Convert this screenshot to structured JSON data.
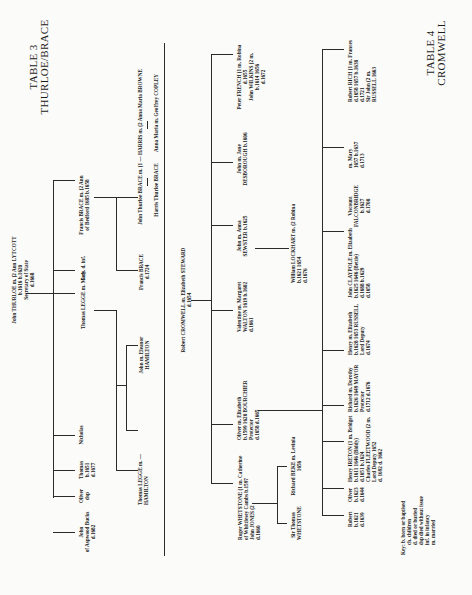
{
  "table3": {
    "title_line1": "TABLE 3",
    "title_line2": "THURLOE/BRACE",
    "root": [
      "John THURLOE m. (2 Ann LYTCOTT",
      "b.1616            b.1620",
      "Secretary of State",
      "d.1668"
    ],
    "children": [
      {
        "lines": [
          "John",
          "of Aspwood Bucks",
          "d.1682"
        ]
      },
      {
        "lines": [
          "Oliver",
          "",
          "dsp"
        ]
      },
      {
        "lines": [
          "Thomas",
          "b.1651",
          "d.1677"
        ]
      },
      {
        "lines": [
          "Nicholas"
        ]
      },
      {
        "lines": [
          "Thomas LEGGE m. Mary"
        ]
      },
      {
        "lines": [
          "5 ch. d. inf."
        ]
      },
      {
        "lines": [
          "Francis BRACE m. (2 Ann",
          "of Bedford 1685   b.1658"
        ]
      }
    ],
    "legge_children": [
      {
        "lines": [
          "Thomas LEGGE    m. —",
          "                HAMILTON"
        ]
      },
      {
        "lines": [
          "John m. Eleanor",
          "HAMILTON"
        ]
      }
    ],
    "brace_children": [
      {
        "lines": [
          "Francis BRACE",
          "d.1724"
        ]
      },
      {
        "lines": [
          "John Thurloe BRACE m. (1 — HARRIS    m. (2 Anna Maria BROWNE"
        ]
      }
    ],
    "brace_grandchildren": [
      {
        "lines": [
          "Harris Thurloe BRACE"
        ]
      },
      {
        "lines": [
          "Anna Maria m. Geoffrey COPLEY"
        ]
      }
    ]
  },
  "table4": {
    "title_line1": "TABLE 4",
    "title_line2": "CROMWELL",
    "root": [
      "Robert CROMWELL m. Elizabeth STEWARD",
      "d.1654"
    ],
    "children": [
      {
        "lines": [
          "Roger WHETSTONE (1 m. Catherine",
          "of Whittlesey Cambs   b.1597",
          "John JONES (2",
          "d.1660"
        ]
      },
      {
        "lines": [
          "Oliver    m.    Elizabeth",
          "b.1599   1620  BOURCHIER",
          "Protector",
          "d.1658          d.1665"
        ]
      },
      {
        "lines": [
          "Valentine m. Margaret",
          "WALTON  1619  b.1602",
          "",
          "d.1661"
        ]
      },
      {
        "lines": [
          "William LOCKHART m. (2 Robina",
          "b.1621         1654",
          "d.1676"
        ]
      },
      {
        "lines": [
          "John m. Anna",
          "SEWSTER  b.1625"
        ]
      },
      {
        "lines": [
          "John m. Jane",
          "DESBOROUGH  b.1606"
        ]
      },
      {
        "lines": [
          "Peter FRENCH (1 m. Robina",
          "d.1655",
          "John WILKINS (2 m.",
          "b.1614       1656",
          "d.1672"
        ]
      }
    ],
    "whetstone_children": [
      {
        "lines": [
          "Sir Thomas",
          "WHETSTONE"
        ]
      },
      {
        "lines": [
          "Richard BEKE m. Levinia",
          "1656"
        ]
      }
    ],
    "oliver_children": [
      {
        "lines": [
          "Robert",
          "b.1621",
          "d.1639"
        ]
      },
      {
        "lines": [
          "Oliver",
          "b.1623",
          "d.1644"
        ]
      },
      {
        "lines": [
          "Henry IRETON (1 m. Bridget",
          "b.1611         1646 (Biddy)",
          "d.1651               b.1624",
          "Charles FLEETWOOD (2 m.",
          "Lord Deputy    1652",
          "d. 1692              d. 1662"
        ]
      },
      {
        "lines": [
          "Richard m.   Dorothy",
          "b.1626  1649 MAYOR",
          "Protector",
          "d.1712          d.1676"
        ]
      },
      {
        "lines": [
          "Henry    m. Elizabeth",
          "b.1628  1653 RUSSELL",
          "Lord Deputy",
          "d.1674"
        ]
      },
      {
        "lines": [
          "John CLAYPOLE m. Elizabeth",
          "b.1625   1646 (Bettie)",
          "d.1688        b.1629",
          "              d.1658"
        ]
      },
      {
        "lines": [
          "Viscount",
          "FALCONBRIDGE",
          "b.1627",
          "d.1700"
        ]
      },
      {
        "lines": [
          "m.   Mary",
          "1657  b.1637",
          "      d.1713"
        ]
      },
      {
        "lines": [
          "Robert RICH (1 m. Frances",
          "d.1658      1657 b.1638",
          "             d.1721",
          "Sir John (2 m.",
          "RUSSELL   1663"
        ]
      }
    ],
    "key": [
      "Key:  b. born or baptised",
      "ch. children",
      "d. died or buried",
      "dsp died without issue",
      "inf. in infancy",
      "m. married"
    ]
  }
}
